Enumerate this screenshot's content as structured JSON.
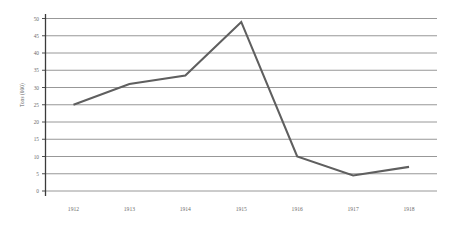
{
  "chart_data": {
    "type": "line",
    "title": "",
    "xlabel": "",
    "ylabel": "Tons (000)",
    "categories": [
      "1912",
      "1913",
      "1914",
      "1915",
      "1916",
      "1917",
      "1918"
    ],
    "values": [
      25,
      31,
      33.5,
      49,
      10,
      4.5,
      7
    ],
    "series": [
      {
        "name": "Tons (000)",
        "values": [
          25,
          31,
          33.5,
          49,
          10,
          4.5,
          7
        ]
      }
    ],
    "ylim": [
      0,
      50
    ],
    "yticks": [
      "0",
      "5",
      "10",
      "15",
      "20",
      "25",
      "30",
      "35",
      "40",
      "45",
      "50"
    ],
    "ytick_values": [
      0,
      5,
      10,
      15,
      20,
      25,
      30,
      35,
      40,
      45,
      50
    ],
    "grid": true,
    "grid_axis": "y",
    "legend": "none",
    "colors": {
      "line": "#5f5f5f",
      "grid": "#8c8c8c",
      "axis": "#3b3b3b",
      "text": "#6b6b6b",
      "background": "#ffffff"
    }
  }
}
